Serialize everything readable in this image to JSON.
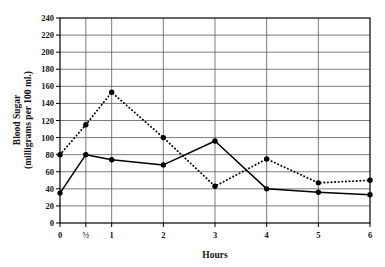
{
  "chart_data": {
    "type": "line",
    "title": "",
    "xlabel": "Hours",
    "ylabel": "Blood Sugar (milligrams per 100 ml.)",
    "ylabel_line1": "Blood Sugar",
    "ylabel_line2": "(milligrams per 100 ml.)",
    "x": [
      0,
      0.5,
      1,
      2,
      3,
      4,
      5,
      6
    ],
    "categories": [
      "0",
      "½",
      "1",
      "2",
      "3",
      "4",
      "5",
      "6"
    ],
    "xtick_labels": [
      "0",
      "½",
      "1",
      "2",
      "3",
      "4",
      "5",
      "6"
    ],
    "ytick_labels": [
      "0",
      "20",
      "40",
      "60",
      "80",
      "100",
      "120",
      "140",
      "160",
      "180",
      "200",
      "220",
      "240"
    ],
    "ytick_values": [
      0,
      20,
      40,
      60,
      80,
      100,
      120,
      140,
      160,
      180,
      200,
      220,
      240
    ],
    "ylim": [
      0,
      240
    ],
    "xlim": [
      0,
      6
    ],
    "grid": true,
    "legend_position": "none",
    "series": [
      {
        "name": "solid-line",
        "style": "solid",
        "color": "#000000",
        "marker": "filled-circle",
        "values": [
          35,
          80,
          74,
          68,
          96,
          40,
          36,
          33
        ]
      },
      {
        "name": "dotted-line",
        "style": "dotted",
        "color": "#000000",
        "marker": "filled-circle",
        "values": [
          80,
          115,
          153,
          100,
          43,
          75,
          47,
          50
        ]
      }
    ]
  },
  "figure": {
    "background_color": "#ffffff",
    "axis_color": "#000000",
    "grid_color": "#5a5a5a"
  }
}
